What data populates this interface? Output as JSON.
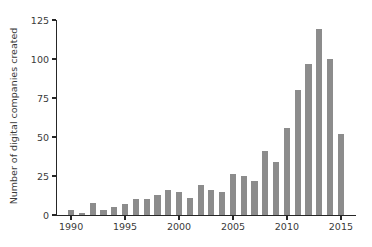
{
  "chart_data": {
    "type": "bar",
    "title": "",
    "xlabel": "",
    "ylabel": "Number of digital companies created",
    "categories": [
      1990,
      1991,
      1992,
      1993,
      1994,
      1995,
      1996,
      1997,
      1998,
      1999,
      2000,
      2001,
      2002,
      2003,
      2004,
      2005,
      2006,
      2007,
      2008,
      2009,
      2010,
      2011,
      2012,
      2013,
      2014,
      2015
    ],
    "values": [
      3,
      1,
      8,
      3,
      5,
      7,
      10,
      10,
      13,
      16,
      15,
      11,
      19,
      16,
      15,
      26,
      25,
      22,
      41,
      34,
      56,
      80,
      97,
      119,
      100,
      52
    ],
    "xlim": [
      1988.6,
      2016.4
    ],
    "ylim": [
      0,
      125
    ],
    "xticks": [
      1990,
      1995,
      2000,
      2005,
      2010,
      2015
    ],
    "xtick_labels": [
      "1990",
      "1995",
      "2000",
      "2005",
      "2010",
      "2015"
    ],
    "yticks": [
      0,
      25,
      50,
      75,
      100,
      125
    ],
    "ytick_labels": [
      "0",
      "25",
      "50",
      "75",
      "100",
      "125"
    ],
    "grid": false,
    "legend": false,
    "bar_color": "#8c8c8c",
    "axis_color": "#262626",
    "background_color": "#ffffff"
  }
}
